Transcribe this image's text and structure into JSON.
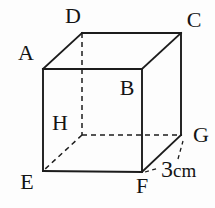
{
  "figure": {
    "background_color": "#fdfdfd",
    "stroke_color": "#1c1c1c",
    "width": 215,
    "height": 208,
    "vertices": {
      "A": {
        "x": 43,
        "y": 69
      },
      "B": {
        "x": 142,
        "y": 69
      },
      "C": {
        "x": 181,
        "y": 33
      },
      "D": {
        "x": 82,
        "y": 33
      },
      "E": {
        "x": 43,
        "y": 171
      },
      "F": {
        "x": 142,
        "y": 172
      },
      "G": {
        "x": 181,
        "y": 135
      },
      "H": {
        "x": 82,
        "y": 135
      }
    },
    "edges": [
      {
        "from": "A",
        "to": "D",
        "style": "solid"
      },
      {
        "from": "D",
        "to": "C",
        "style": "solid"
      },
      {
        "from": "B",
        "to": "C",
        "style": "solid"
      },
      {
        "from": "A",
        "to": "B",
        "style": "solid"
      },
      {
        "from": "A",
        "to": "E",
        "style": "solid"
      },
      {
        "from": "B",
        "to": "F",
        "style": "solid"
      },
      {
        "from": "E",
        "to": "F",
        "style": "solid"
      },
      {
        "from": "C",
        "to": "G",
        "style": "solid"
      },
      {
        "from": "F",
        "to": "G",
        "style": "solid"
      },
      {
        "from": "D",
        "to": "H",
        "style": "dashed"
      },
      {
        "from": "H",
        "to": "G",
        "style": "dashed"
      },
      {
        "from": "H",
        "to": "E",
        "style": "dashed"
      }
    ],
    "labels": [
      {
        "text": "A",
        "x": 26,
        "y": 60
      },
      {
        "text": "B",
        "x": 127,
        "y": 95
      },
      {
        "text": "C",
        "x": 194,
        "y": 27
      },
      {
        "text": "D",
        "x": 73,
        "y": 23
      },
      {
        "text": "E",
        "x": 27,
        "y": 189
      },
      {
        "text": "F",
        "x": 142,
        "y": 193
      },
      {
        "text": "G",
        "x": 201,
        "y": 142
      },
      {
        "text": "H",
        "x": 60,
        "y": 130
      }
    ],
    "dimension": {
      "text": "3cm",
      "value": "3",
      "unit": "cm",
      "edge": "FG",
      "x": 161,
      "y": 177,
      "leaders": [
        {
          "x1": 145,
          "y1": 172,
          "x2": 159,
          "y2": 168
        },
        {
          "x1": 178,
          "y1": 159,
          "x2": 183,
          "y2": 141
        }
      ]
    }
  }
}
